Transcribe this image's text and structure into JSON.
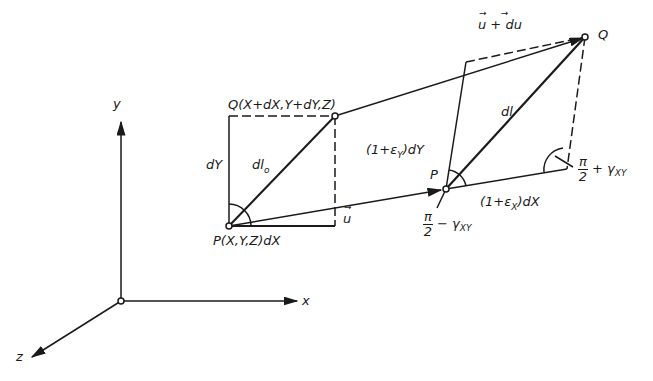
{
  "diagram": {
    "type": "deformation-of-line-element",
    "axes": {
      "x": "x",
      "y": "y",
      "z": "z"
    },
    "undeformed": {
      "point_P": "P(X,Y,Z)",
      "point_Q": "Q(X+dX,Y+dY,Z)",
      "dX_label": "dX",
      "dY_label": "dY",
      "dl0_label": "dl",
      "dl0_sub": "o",
      "displacement_label": "u"
    },
    "deformed": {
      "point_P": "P",
      "point_Q": "Q",
      "dl_label": "dl",
      "side_y_prefix": "(1+ε",
      "side_y_sub": "Y",
      "side_y_suffix": ")dY",
      "side_x_prefix": "(1+ε",
      "side_x_sub": "X",
      "side_x_suffix": ")dX",
      "displacement_Q_label": "u + du",
      "angle_minus": {
        "num": "π",
        "den": "2",
        "op": "−",
        "gamma": "γ",
        "sub": "XY"
      },
      "angle_plus": {
        "num": "π",
        "den": "2",
        "op": "+",
        "gamma": "γ",
        "sub": "XY"
      }
    }
  }
}
